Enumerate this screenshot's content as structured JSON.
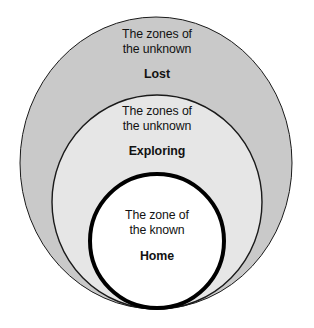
{
  "diagram": {
    "type": "nested-circles",
    "background_color": "#ffffff",
    "zones": [
      {
        "id": "outer",
        "name": "Lost",
        "description_line1": "The zones of",
        "description_line2": "the unknown",
        "fill_color": "#c9c9c9",
        "stroke_color": "#1a1a1a",
        "stroke_width": "1",
        "ellipse": {
          "cx": 156,
          "cy": 163,
          "rx": 136,
          "ry": 146
        }
      },
      {
        "id": "middle",
        "name": "Exploring",
        "description_line1": "The zones of",
        "description_line2": "the unknown",
        "fill_color": "#e6e6e6",
        "stroke_color": "#1a1a1a",
        "stroke_width": "1.4",
        "ellipse": {
          "cx": 157,
          "cy": 202,
          "rx": 105,
          "ry": 107
        }
      },
      {
        "id": "inner",
        "name": "Home",
        "description_line1": "The zone of",
        "description_line2": "the known",
        "fill_color": "#ffffff",
        "stroke_color": "#000000",
        "stroke_width": "4",
        "ellipse": {
          "cx": 157,
          "cy": 241,
          "rx": 67,
          "ry": 67
        }
      }
    ]
  }
}
